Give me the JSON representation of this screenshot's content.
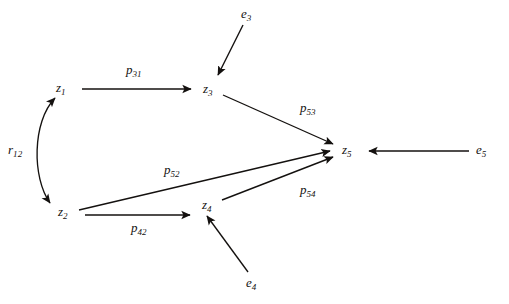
{
  "figure": {
    "type": "path-diagram",
    "background_color": "#ffffff",
    "ink_color": "#14110f",
    "top_strip_text": "",
    "width": 509,
    "height": 304
  },
  "nodes": [
    {
      "id": "z1",
      "base": "z",
      "sub": "1",
      "x": 62,
      "y": 88,
      "kind": "latent"
    },
    {
      "id": "z2",
      "base": "z",
      "sub": "2",
      "x": 64,
      "y": 212,
      "kind": "latent"
    },
    {
      "id": "z3",
      "base": "z",
      "sub": "3",
      "x": 209,
      "y": 89,
      "kind": "latent"
    },
    {
      "id": "z4",
      "base": "z",
      "sub": "4",
      "x": 208,
      "y": 205,
      "kind": "latent"
    },
    {
      "id": "z5",
      "base": "z",
      "sub": "5",
      "x": 348,
      "y": 150,
      "kind": "latent"
    }
  ],
  "disturbances": [
    {
      "id": "e3",
      "base": "e",
      "sub": "3",
      "x": 247,
      "y": 14,
      "target": "z3"
    },
    {
      "id": "e4",
      "base": "e",
      "sub": "4",
      "x": 252,
      "y": 283,
      "target": "z4"
    },
    {
      "id": "e5",
      "base": "e",
      "sub": "5",
      "x": 482,
      "y": 150,
      "target": "z5"
    }
  ],
  "edges": [
    {
      "id": "p31",
      "base": "p",
      "sub": "31",
      "from": "z1",
      "to": "z3",
      "x": 136,
      "y": 70,
      "head": "single"
    },
    {
      "id": "p53",
      "base": "p",
      "sub": "53",
      "from": "z3",
      "to": "z5",
      "x": 312,
      "y": 108,
      "head": "single"
    },
    {
      "id": "p52",
      "base": "p",
      "sub": "52",
      "from": "z2",
      "to": "z5",
      "x": 175,
      "y": 170,
      "head": "single"
    },
    {
      "id": "p42",
      "base": "p",
      "sub": "42",
      "from": "z2",
      "to": "z4",
      "x": 142,
      "y": 228,
      "head": "single"
    },
    {
      "id": "p54",
      "base": "p",
      "sub": "54",
      "from": "z4",
      "to": "z5",
      "x": 312,
      "y": 190,
      "head": "single"
    }
  ],
  "correlations": [
    {
      "id": "r12",
      "base": "r",
      "sub": "12",
      "between": [
        "z1",
        "z2"
      ],
      "x": 14,
      "y": 150,
      "head": "double",
      "shape": "curved"
    }
  ]
}
